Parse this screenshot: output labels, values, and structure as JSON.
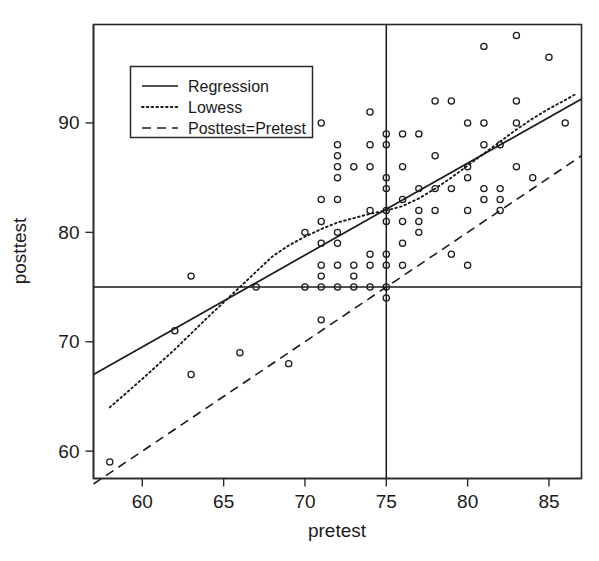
{
  "chart_data": {
    "type": "scatter",
    "title": "",
    "xlabel": "pretest",
    "ylabel": "posttest",
    "xlim": [
      57,
      87
    ],
    "ylim": [
      57.5,
      99
    ],
    "xticks": [
      60,
      65,
      70,
      75,
      80,
      85
    ],
    "yticks": [
      60,
      70,
      80,
      90
    ],
    "xticklabels": [
      "60",
      "65",
      "70",
      "75",
      "80",
      "85"
    ],
    "yticklabels": [
      "60",
      "70",
      "80",
      "90"
    ],
    "grid": false,
    "legend_position": "upper-left",
    "marker": "open-circle",
    "points": [
      [
        58,
        59
      ],
      [
        62,
        71
      ],
      [
        63,
        76
      ],
      [
        63,
        67
      ],
      [
        66,
        69
      ],
      [
        67,
        75
      ],
      [
        69,
        68
      ],
      [
        70,
        75
      ],
      [
        70,
        80
      ],
      [
        71,
        72
      ],
      [
        71,
        75
      ],
      [
        71,
        76
      ],
      [
        71,
        77
      ],
      [
        71,
        79
      ],
      [
        71,
        81
      ],
      [
        71,
        83
      ],
      [
        71,
        90
      ],
      [
        72,
        75
      ],
      [
        72,
        77
      ],
      [
        72,
        79
      ],
      [
        72,
        80
      ],
      [
        72,
        83
      ],
      [
        72,
        85
      ],
      [
        72,
        86
      ],
      [
        72,
        87
      ],
      [
        72,
        88
      ],
      [
        73,
        75
      ],
      [
        73,
        76
      ],
      [
        73,
        77
      ],
      [
        73,
        86
      ],
      [
        74,
        75
      ],
      [
        74,
        77
      ],
      [
        74,
        78
      ],
      [
        74,
        82
      ],
      [
        74,
        86
      ],
      [
        74,
        88
      ],
      [
        74,
        91
      ],
      [
        75,
        74
      ],
      [
        75,
        75
      ],
      [
        75,
        77
      ],
      [
        75,
        78
      ],
      [
        75,
        81
      ],
      [
        75,
        82
      ],
      [
        75,
        84
      ],
      [
        75,
        85
      ],
      [
        75,
        88
      ],
      [
        75,
        89
      ],
      [
        76,
        77
      ],
      [
        76,
        79
      ],
      [
        76,
        81
      ],
      [
        76,
        83
      ],
      [
        76,
        86
      ],
      [
        76,
        89
      ],
      [
        77,
        80
      ],
      [
        77,
        81
      ],
      [
        77,
        82
      ],
      [
        77,
        84
      ],
      [
        77,
        89
      ],
      [
        78,
        82
      ],
      [
        78,
        84
      ],
      [
        78,
        87
      ],
      [
        78,
        92
      ],
      [
        79,
        78
      ],
      [
        79,
        84
      ],
      [
        79,
        92
      ],
      [
        80,
        77
      ],
      [
        80,
        82
      ],
      [
        80,
        85
      ],
      [
        80,
        86
      ],
      [
        80,
        90
      ],
      [
        81,
        83
      ],
      [
        81,
        84
      ],
      [
        81,
        88
      ],
      [
        81,
        90
      ],
      [
        81,
        97
      ],
      [
        82,
        82
      ],
      [
        82,
        83
      ],
      [
        82,
        84
      ],
      [
        82,
        88
      ],
      [
        83,
        86
      ],
      [
        83,
        90
      ],
      [
        83,
        92
      ],
      [
        83,
        98
      ],
      [
        84,
        85
      ],
      [
        85,
        96
      ],
      [
        86,
        90
      ]
    ],
    "series": [
      {
        "name": "Regression",
        "style": "solid",
        "points": [
          [
            57,
            67.0
          ],
          [
            87,
            92.2
          ]
        ]
      },
      {
        "name": "Lowess",
        "style": "dotted",
        "points": [
          [
            58,
            64.0
          ],
          [
            60,
            66.6
          ],
          [
            62,
            69.3
          ],
          [
            64,
            72.2
          ],
          [
            66,
            75.0
          ],
          [
            67,
            76.4
          ],
          [
            68,
            77.8
          ],
          [
            69,
            78.8
          ],
          [
            70,
            79.6
          ],
          [
            71,
            80.3
          ],
          [
            72,
            80.9
          ],
          [
            73,
            81.3
          ],
          [
            74,
            81.7
          ],
          [
            75,
            82.0
          ],
          [
            76,
            82.4
          ],
          [
            77,
            83.1
          ],
          [
            78,
            84.0
          ],
          [
            79,
            85.0
          ],
          [
            80,
            86.1
          ],
          [
            81,
            87.2
          ],
          [
            82,
            88.3
          ],
          [
            83,
            89.4
          ],
          [
            84,
            90.4
          ],
          [
            85,
            91.3
          ],
          [
            86,
            92.1
          ],
          [
            86.6,
            92.6
          ]
        ]
      },
      {
        "name": "Posttest=Pretest",
        "style": "dashed",
        "points": [
          [
            57,
            57
          ],
          [
            87,
            87
          ]
        ]
      }
    ],
    "reference_lines": [
      {
        "name": "horizontal-reference-75",
        "orientation": "horizontal",
        "value": 75
      },
      {
        "name": "vertical-reference-75",
        "orientation": "vertical",
        "value": 75
      }
    ]
  },
  "legend": {
    "items": [
      {
        "label": "Regression",
        "style": "solid"
      },
      {
        "label": "Lowess",
        "style": "dotted"
      },
      {
        "label": "Posttest=Pretest",
        "style": "dashed"
      }
    ]
  },
  "axes": {
    "x_title": "pretest",
    "y_title": "posttest"
  }
}
